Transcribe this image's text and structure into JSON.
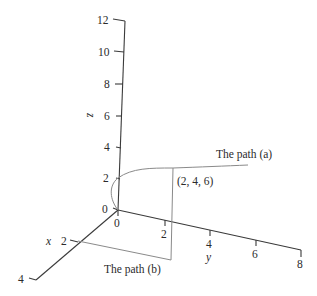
{
  "diagram": {
    "type": "3d-axes",
    "axes": {
      "z": {
        "label": "z",
        "ticks": [
          "0",
          "2",
          "4",
          "6",
          "8",
          "10",
          "12"
        ]
      },
      "x": {
        "label": "x",
        "ticks": [
          "2",
          "4"
        ]
      },
      "y": {
        "label": "y",
        "ticks": [
          "0",
          "2",
          "4",
          "6",
          "8"
        ]
      }
    },
    "point_label": "(2, 4, 6)",
    "paths": {
      "a": {
        "label": "The path (a)"
      },
      "b": {
        "label": "The path (b)"
      }
    },
    "colors": {
      "axis": "#3a3a3a",
      "path": "#8a8a8a",
      "text": "#2b2b2b"
    }
  }
}
